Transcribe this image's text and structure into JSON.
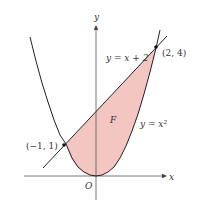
{
  "diagram": {
    "axes": {
      "x_label": "x",
      "y_label": "y",
      "origin_label": "O"
    },
    "curves": {
      "line_label": "y = x + 2",
      "parabola_label": "y = x²"
    },
    "region_label": "F",
    "points": [
      {
        "label": "(−1, 1)",
        "x": -1,
        "y": 1
      },
      {
        "label": "(2, 4)",
        "x": 2,
        "y": 4
      }
    ],
    "colors": {
      "fill": "#f4c6c2",
      "stroke": "#222222",
      "axis": "#555555"
    }
  }
}
